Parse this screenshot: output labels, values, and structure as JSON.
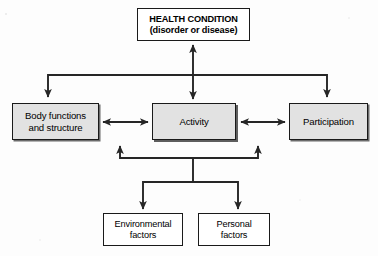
{
  "diagram": {
    "stroke_color": "#262626",
    "box_fill_shaded": "#e2e2e2",
    "box_fill_plain": "#ffffff",
    "nodes": {
      "health_condition": {
        "line1": "HEALTH CONDITION",
        "line2": "(disorder or disease)"
      },
      "body_functions": {
        "line1": "Body functions",
        "line2": "and structure"
      },
      "activity": {
        "line1": "Activity"
      },
      "participation": {
        "line1": "Participation"
      },
      "environmental_factors": {
        "line1": "Environmental",
        "line2": "factors"
      },
      "personal_factors": {
        "line1": "Personal",
        "line2": "factors"
      }
    },
    "connectors": [
      {
        "name": "health-to-activity",
        "kind": "double-arrow-vertical"
      },
      {
        "name": "health-bus-to-body-functions",
        "kind": "elbow-arrow-down"
      },
      {
        "name": "health-bus-to-participation",
        "kind": "elbow-arrow-down"
      },
      {
        "name": "body-functions-to-activity",
        "kind": "double-arrow-horizontal"
      },
      {
        "name": "activity-to-participation",
        "kind": "double-arrow-horizontal"
      },
      {
        "name": "contextual-bus-to-body-functions",
        "kind": "elbow-arrow-up"
      },
      {
        "name": "contextual-bus-to-participation",
        "kind": "elbow-arrow-up"
      },
      {
        "name": "bus-to-environmental-factors",
        "kind": "elbow-arrow-down"
      },
      {
        "name": "bus-to-personal-factors",
        "kind": "elbow-arrow-down"
      }
    ]
  }
}
